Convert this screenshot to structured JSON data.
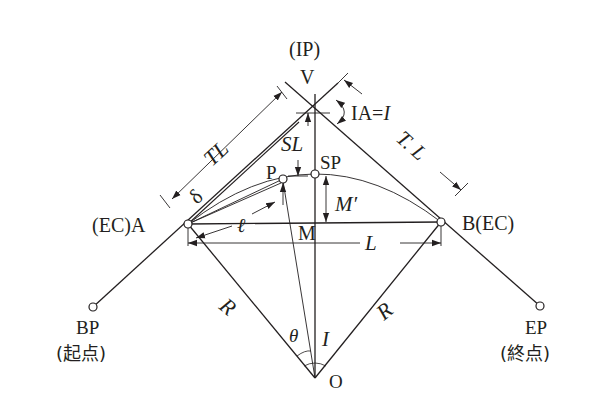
{
  "figure": {
    "type": "circular-curve-geometry",
    "labels": {
      "ip_top": "(IP)",
      "v": "V",
      "ia": "IA=",
      "ia_i": "I",
      "tl_left": "TL",
      "tl_right": "T. L",
      "sl": "SL",
      "delta": "δ",
      "p": "P",
      "sp": "SP",
      "m_prime": "M′",
      "ell": "ℓ",
      "m": "M",
      "l": "L",
      "a": "(EC)A",
      "b": "B(EC)",
      "bp": "BP",
      "bp_jp": "(起点)",
      "ep": "EP",
      "ep_jp": "(終点)",
      "r_left": "R",
      "r_right": "R",
      "theta": "θ",
      "i_center": "I",
      "o": "O"
    },
    "points": {
      "V": [
        312,
        108
      ],
      "A": [
        188,
        224
      ],
      "B": [
        441,
        222
      ],
      "O": [
        315,
        378
      ],
      "M": [
        315,
        224
      ],
      "SP": [
        315,
        174
      ],
      "P": [
        283,
        179
      ],
      "BP": [
        93,
        307
      ],
      "EP": [
        540,
        306
      ]
    },
    "colors": {
      "ink": "#231f20",
      "background": "#ffffff"
    }
  }
}
